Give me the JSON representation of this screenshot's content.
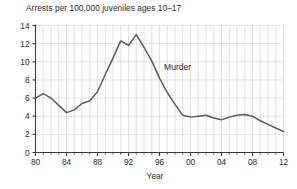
{
  "chart_data": {
    "type": "line",
    "title": "Arrests per 100,000 juveniles ages 10–17",
    "xlabel": "Year",
    "ylabel": "",
    "xlim": [
      1980,
      2012
    ],
    "ylim": [
      0,
      14
    ],
    "grid": true,
    "legend_position": "inline-annotation",
    "annotations": [
      {
        "text": "Murder",
        "x": 1996,
        "y": 8.2
      }
    ],
    "y_ticks": [
      0,
      2,
      4,
      6,
      8,
      10,
      12,
      14
    ],
    "y_tick_labels": [
      "0",
      "2",
      "4",
      "6",
      "8",
      "10",
      "12",
      "14"
    ],
    "x_ticks": [
      1980,
      1984,
      1988,
      1992,
      1996,
      2000,
      2004,
      2008,
      2012
    ],
    "x_tick_labels": [
      "80",
      "84",
      "88",
      "92",
      "96",
      "00",
      "04",
      "08",
      "12"
    ],
    "x_minor_ticks_every": 1,
    "series": [
      {
        "name": "Murder",
        "color": "#5a5a5a",
        "x": [
          1980,
          1981,
          1982,
          1983,
          1984,
          1985,
          1986,
          1987,
          1988,
          1989,
          1990,
          1991,
          1992,
          1993,
          1994,
          1995,
          1996,
          1997,
          1998,
          1999,
          2000,
          2001,
          2002,
          2003,
          2004,
          2005,
          2006,
          2007,
          2008,
          2009,
          2010,
          2011,
          2012
        ],
        "values": [
          6.0,
          6.5,
          6.0,
          5.2,
          4.4,
          4.7,
          5.4,
          5.7,
          6.7,
          8.6,
          10.4,
          12.3,
          11.8,
          13.0,
          11.6,
          10.1,
          8.2,
          6.6,
          5.3,
          4.1,
          3.9,
          4.0,
          4.1,
          3.8,
          3.6,
          3.9,
          4.1,
          4.2,
          4.0,
          3.5,
          3.1,
          2.7,
          2.3
        ]
      }
    ]
  },
  "axes": {
    "x_title": "Year"
  }
}
